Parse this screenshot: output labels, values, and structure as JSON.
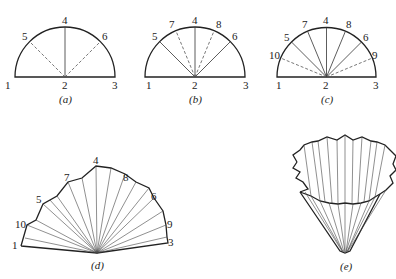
{
  "figure": {
    "panels": [
      {
        "id": "a",
        "caption": "(a)",
        "point_labels": [
          "1",
          "2",
          "3",
          "4",
          "5",
          "6"
        ],
        "description": "Semicircle with base 1-2-3, solid radius 2-4, dashed radii 2-5 and 2-6"
      },
      {
        "id": "b",
        "caption": "(b)",
        "point_labels": [
          "1",
          "2",
          "3",
          "4",
          "5",
          "6",
          "7",
          "8"
        ],
        "description": "Semicircle with solid radii to 4, 5, 6 and dashed radii to 7, 8"
      },
      {
        "id": "c",
        "caption": "(c)",
        "point_labels": [
          "1",
          "2",
          "3",
          "4",
          "5",
          "6",
          "7",
          "8",
          "9",
          "10"
        ],
        "description": "Semicircle with solid radii to 4-8 and dashed radii to 9, 10"
      },
      {
        "id": "d",
        "caption": "(d)",
        "point_labels": [
          "1",
          "3",
          "4",
          "5",
          "6",
          "7",
          "8",
          "9",
          "10"
        ],
        "description": "Folded pleated fan from the semicircle"
      },
      {
        "id": "e",
        "caption": "(e)",
        "point_labels": [],
        "description": "Pleated cone (filter paper) formed by folding"
      }
    ]
  }
}
